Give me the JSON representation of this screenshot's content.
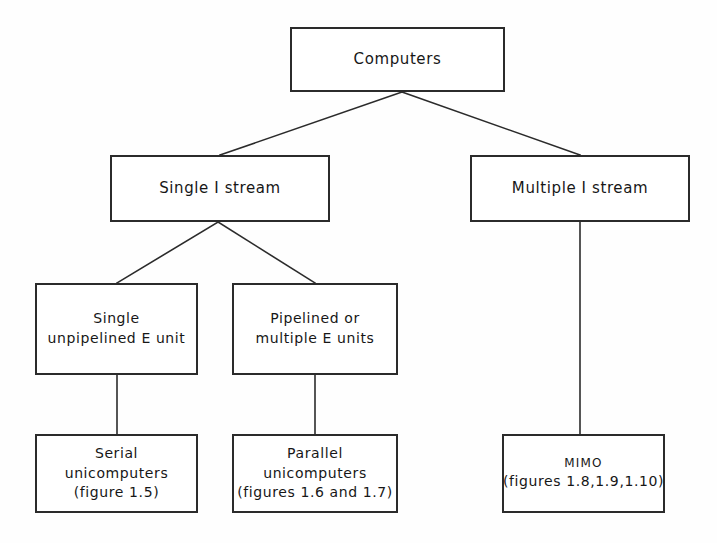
{
  "figure": {
    "type": "tree-diagram",
    "title_text": "Computers",
    "background_color": "#fefefe",
    "line_color": "#2b2b2b",
    "text_color": "#171717"
  },
  "nodes": {
    "root": {
      "id": "computers",
      "lines": [
        "Computers"
      ],
      "x": 290,
      "y": 27,
      "w": 215,
      "h": 65
    },
    "single_i_stream": {
      "id": "single-i-stream",
      "lines": [
        "Single I stream"
      ],
      "x": 110,
      "y": 155,
      "w": 220,
      "h": 67
    },
    "multiple_i_stream": {
      "id": "multiple-i-stream",
      "lines": [
        "Multiple I stream"
      ],
      "x": 470,
      "y": 155,
      "w": 220,
      "h": 67
    },
    "single_unpipelined": {
      "id": "single-unpipelined-e-unit",
      "lines": [
        "Single",
        "unpipelined E unit"
      ],
      "x": 35,
      "y": 283,
      "w": 163,
      "h": 92
    },
    "pipelined_multiple": {
      "id": "pipelined-or-multiple-e-units",
      "lines": [
        "Pipelined or",
        "multiple E units"
      ],
      "x": 232,
      "y": 283,
      "w": 166,
      "h": 92
    },
    "serial_unicomputers": {
      "id": "serial-unicomputers",
      "lines": [
        "Serial",
        "unicomputers",
        "(figure 1.5)"
      ],
      "x": 35,
      "y": 434,
      "w": 163,
      "h": 79
    },
    "parallel_unicomputers": {
      "id": "parallel-unicomputers",
      "lines": [
        "Parallel",
        "unicomputers",
        "(figures 1.6 and 1.7)"
      ],
      "x": 232,
      "y": 434,
      "w": 166,
      "h": 79
    },
    "mimo": {
      "id": "mimo",
      "lines": [
        "MIMO",
        "(figures 1.8,1.9,1.10)"
      ],
      "x": 502,
      "y": 434,
      "w": 163,
      "h": 79
    }
  },
  "edges": [
    {
      "name": "computers-to-single-i-stream",
      "from": "computers",
      "to": "single-i-stream",
      "points": "402,92 220,155"
    },
    {
      "name": "computers-to-multiple-i-stream",
      "from": "computers",
      "to": "multiple-i-stream",
      "points": "402,92 580,155"
    },
    {
      "name": "single-i-stream-to-single-unpipelined",
      "from": "single-i-stream",
      "to": "single-unpipelined-e-unit",
      "points": "218,222 117,283"
    },
    {
      "name": "single-i-stream-to-pipelined-multiple",
      "from": "single-i-stream",
      "to": "pipelined-or-multiple-e-units",
      "points": "218,222 315,283"
    },
    {
      "name": "single-unpipelined-to-serial",
      "from": "single-unpipelined-e-unit",
      "to": "serial-unicomputers",
      "points": "117,375 117,434"
    },
    {
      "name": "pipelined-multiple-to-parallel",
      "from": "pipelined-or-multiple-e-units",
      "to": "parallel-unicomputers",
      "points": "315,375 315,434"
    },
    {
      "name": "multiple-i-stream-to-mimo",
      "from": "multiple-i-stream",
      "to": "mimo",
      "points": "580,222 580,434"
    }
  ]
}
